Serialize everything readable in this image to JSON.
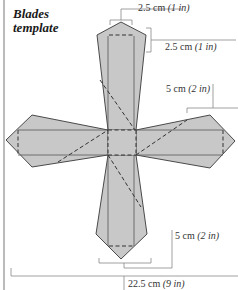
{
  "title": {
    "line1": "Blades",
    "line2": "template"
  },
  "dimensions": [
    {
      "id": "tip-width",
      "value": "2.5 cm",
      "imperial": "(1 in)"
    },
    {
      "id": "tip-height",
      "value": "2.5 cm",
      "imperial": "(1 in)"
    },
    {
      "id": "blade-width",
      "value": "5 cm",
      "imperial": "(2 in)"
    },
    {
      "id": "blade-bottom-width",
      "value": "5 cm",
      "imperial": "(2 in)"
    },
    {
      "id": "total-width",
      "value": "22.5 cm",
      "imperial": "(9 in)"
    }
  ],
  "colors": {
    "fill": "#c8c8c8",
    "outline": "#4a4a4a",
    "dim_line": "#888888",
    "text": "#333333"
  }
}
